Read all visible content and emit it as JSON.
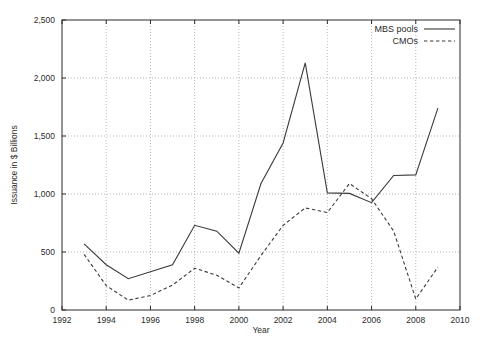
{
  "chart_data": {
    "type": "line",
    "title": "",
    "xlabel": "Year",
    "ylabel": "Issuance in $ Billions",
    "xlim": [
      1992,
      2010
    ],
    "ylim": [
      0,
      2500
    ],
    "grid": true,
    "legend_position": "top-right",
    "x_ticks": [
      1992,
      1994,
      1996,
      1998,
      2000,
      2002,
      2004,
      2006,
      2008,
      2010
    ],
    "x_tick_labels": [
      "1992",
      "1994",
      "1996",
      "1998",
      "2000",
      "2002",
      "2004",
      "2006",
      "2008",
      "2010"
    ],
    "y_ticks": [
      0,
      500,
      1000,
      1500,
      2000,
      2500
    ],
    "y_tick_labels": [
      "0",
      "500",
      "1,000",
      "1,500",
      "2,000",
      "2,500"
    ],
    "x": [
      1993,
      1994,
      1995,
      1996,
      1997,
      1998,
      1999,
      2000,
      2001,
      2002,
      2003,
      2004,
      2005,
      2006,
      2007,
      2008,
      2009
    ],
    "series": [
      {
        "name": "MBS pools",
        "style": "solid",
        "color": "#3a3a3a",
        "values": [
          570,
          390,
          270,
          330,
          390,
          730,
          680,
          490,
          1090,
          1440,
          2130,
          1010,
          1005,
          925,
          1160,
          1165,
          1740
        ]
      },
      {
        "name": "CMOs",
        "style": "dashed",
        "color": "#3a3a3a",
        "values": [
          480,
          210,
          85,
          125,
          215,
          360,
          300,
          190,
          470,
          730,
          880,
          840,
          1090,
          960,
          680,
          95,
          370
        ]
      }
    ]
  },
  "legend": {
    "entries": [
      {
        "label": "MBS pools",
        "style": "solid"
      },
      {
        "label": "CMOs",
        "style": "dashed"
      }
    ]
  },
  "axes": {
    "x_title": "Year",
    "y_title": "Issuance in $ Billions"
  }
}
